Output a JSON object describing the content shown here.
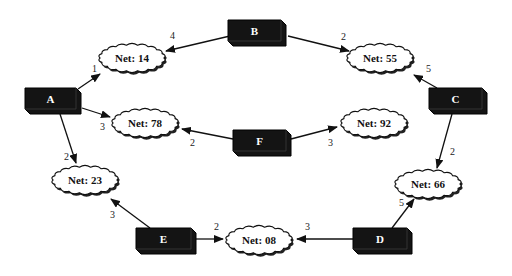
{
  "routers": [
    {
      "id": "A",
      "label": "A",
      "x": 25,
      "y": 88,
      "w": 56,
      "h": 26
    },
    {
      "id": "B",
      "label": "B",
      "x": 228,
      "y": 20,
      "w": 58,
      "h": 26
    },
    {
      "id": "C",
      "label": "C",
      "x": 429,
      "y": 88,
      "w": 58,
      "h": 26
    },
    {
      "id": "D",
      "label": "D",
      "x": 353,
      "y": 228,
      "w": 59,
      "h": 26
    },
    {
      "id": "E",
      "label": "E",
      "x": 136,
      "y": 228,
      "w": 60,
      "h": 26
    },
    {
      "id": "F",
      "label": "F",
      "x": 233,
      "y": 130,
      "w": 58,
      "h": 26
    }
  ],
  "networks": [
    {
      "id": "n14",
      "label": "Net: 14",
      "cx": 132,
      "cy": 58
    },
    {
      "id": "n55",
      "label": "Net: 55",
      "cx": 380,
      "cy": 58
    },
    {
      "id": "n78",
      "label": "Net: 78",
      "cx": 145,
      "cy": 123
    },
    {
      "id": "n92",
      "label": "Net: 92",
      "cx": 374,
      "cy": 123
    },
    {
      "id": "n23",
      "label": "Net: 23",
      "cx": 85,
      "cy": 180
    },
    {
      "id": "n66",
      "label": "Net: 66",
      "cx": 428,
      "cy": 184
    },
    {
      "id": "n08",
      "label": "Net: 08",
      "cx": 259,
      "cy": 240
    }
  ],
  "links": [
    {
      "from": "A",
      "to": "n14",
      "cost": "1",
      "x1": 78,
      "y1": 89,
      "x2": 100,
      "y2": 74,
      "lx": 92,
      "ly": 72
    },
    {
      "from": "A",
      "to": "n78",
      "cost": "3",
      "x1": 82,
      "y1": 108,
      "x2": 110,
      "y2": 117,
      "lx": 100,
      "ly": 130
    },
    {
      "from": "A",
      "to": "n23",
      "cost": "2",
      "x1": 60,
      "y1": 114,
      "x2": 76,
      "y2": 163,
      "lx": 64,
      "ly": 160
    },
    {
      "from": "B",
      "to": "n14",
      "cost": "4",
      "x1": 230,
      "y1": 36,
      "x2": 166,
      "y2": 51,
      "lx": 170,
      "ly": 39
    },
    {
      "from": "B",
      "to": "n55",
      "cost": "2",
      "x1": 288,
      "y1": 36,
      "x2": 349,
      "y2": 51,
      "lx": 341,
      "ly": 40
    },
    {
      "from": "C",
      "to": "n55",
      "cost": "5",
      "x1": 437,
      "y1": 88,
      "x2": 414,
      "y2": 75,
      "lx": 426,
      "ly": 72
    },
    {
      "from": "C",
      "to": "n66",
      "cost": "2",
      "x1": 452,
      "y1": 114,
      "x2": 437,
      "y2": 168,
      "lx": 450,
      "ly": 155
    },
    {
      "from": "F",
      "to": "n78",
      "cost": "2",
      "x1": 233,
      "y1": 139,
      "x2": 182,
      "y2": 129,
      "lx": 190,
      "ly": 146
    },
    {
      "from": "F",
      "to": "n92",
      "cost": "3",
      "x1": 291,
      "y1": 139,
      "x2": 337,
      "y2": 127,
      "lx": 328,
      "ly": 146
    },
    {
      "from": "E",
      "to": "n23",
      "cost": "3",
      "x1": 150,
      "y1": 228,
      "x2": 111,
      "y2": 199,
      "lx": 110,
      "ly": 218
    },
    {
      "from": "E",
      "to": "n08",
      "cost": "2",
      "x1": 196,
      "y1": 239,
      "x2": 223,
      "y2": 239,
      "lx": 214,
      "ly": 230
    },
    {
      "from": "D",
      "to": "n08",
      "cost": "3",
      "x1": 353,
      "y1": 239,
      "x2": 297,
      "y2": 239,
      "lx": 305,
      "ly": 230
    },
    {
      "from": "D",
      "to": "n66",
      "cost": "5",
      "x1": 392,
      "y1": 228,
      "x2": 414,
      "y2": 199,
      "lx": 399,
      "ly": 206
    }
  ]
}
